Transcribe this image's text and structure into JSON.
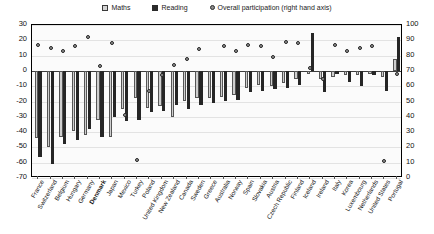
{
  "legend": {
    "items": [
      {
        "label": "Maths",
        "marker": "square-light",
        "name": "legend-maths"
      },
      {
        "label": "Reading",
        "marker": "square-dark",
        "name": "legend-reading"
      },
      {
        "label": "Overall participation (right hand axis)",
        "marker": "dot",
        "name": "legend-overall"
      }
    ]
  },
  "axes": {
    "left_ticks": [
      30,
      20,
      10,
      0,
      -10,
      -20,
      -30,
      -40,
      -50,
      -60,
      -70
    ],
    "right_ticks": [
      100,
      90,
      80,
      70,
      60,
      50,
      40,
      30,
      20,
      10,
      0
    ]
  },
  "highlight_country": "Denmark",
  "colors": {
    "maths": "#cfcfcf",
    "reading": "#262626",
    "overall": "#9a9a9a",
    "axis": "#000000",
    "grid": "#e3e3e3"
  },
  "chart_data": {
    "type": "bar",
    "title": "",
    "xlabel": "",
    "ylabel": "",
    "ylim": [
      -70,
      30
    ],
    "y2lim": [
      0,
      100
    ],
    "grid": true,
    "legend_position": "top-center",
    "categories": [
      "France",
      "Switzerland",
      "Belgium",
      "Hungary",
      "Germany",
      "Denmark",
      "Japan",
      "Mexico",
      "Turkey",
      "Poland",
      "United Kingdom",
      "New Zealand",
      "Canada",
      "Sweden",
      "Greece",
      "Australia",
      "Norway",
      "Spain",
      "Slovakia",
      "Austria",
      "Czech Republic",
      "Finland",
      "Iceland",
      "Ireland",
      "Italy",
      "Korea",
      "Luxembourg",
      "Netherlands",
      "United States",
      "Portugal"
    ],
    "series": [
      {
        "name": "Maths",
        "axis": "left",
        "values": [
          -44,
          -50,
          -43,
          -39,
          -42,
          -32,
          -43,
          -25,
          -18,
          -24,
          -23,
          -30,
          -20,
          -18,
          -18,
          -17,
          -16,
          -11,
          -9,
          -10,
          -8,
          -5,
          -2,
          -5,
          -4,
          -3,
          -3,
          -2,
          -4,
          8
        ]
      },
      {
        "name": "Reading",
        "axis": "left",
        "values": [
          -56,
          -61,
          -48,
          -45,
          -38,
          -43,
          -30,
          -33,
          -32,
          -27,
          -26,
          -22,
          -25,
          -22,
          -21,
          -20,
          -19,
          -14,
          -13,
          -12,
          -11,
          -9,
          25,
          -14,
          -2,
          -7,
          -10,
          -3,
          -13,
          22
        ]
      },
      {
        "name": "Overall participation (right hand axis)",
        "axis": "right",
        "values": [
          87,
          85,
          83,
          86,
          92,
          73,
          88,
          41,
          12,
          57,
          67,
          74,
          78,
          84,
          null,
          86,
          83,
          87,
          86,
          79,
          89,
          88,
          72,
          65,
          87,
          83,
          85,
          86,
          11,
          68
        ]
      }
    ]
  }
}
